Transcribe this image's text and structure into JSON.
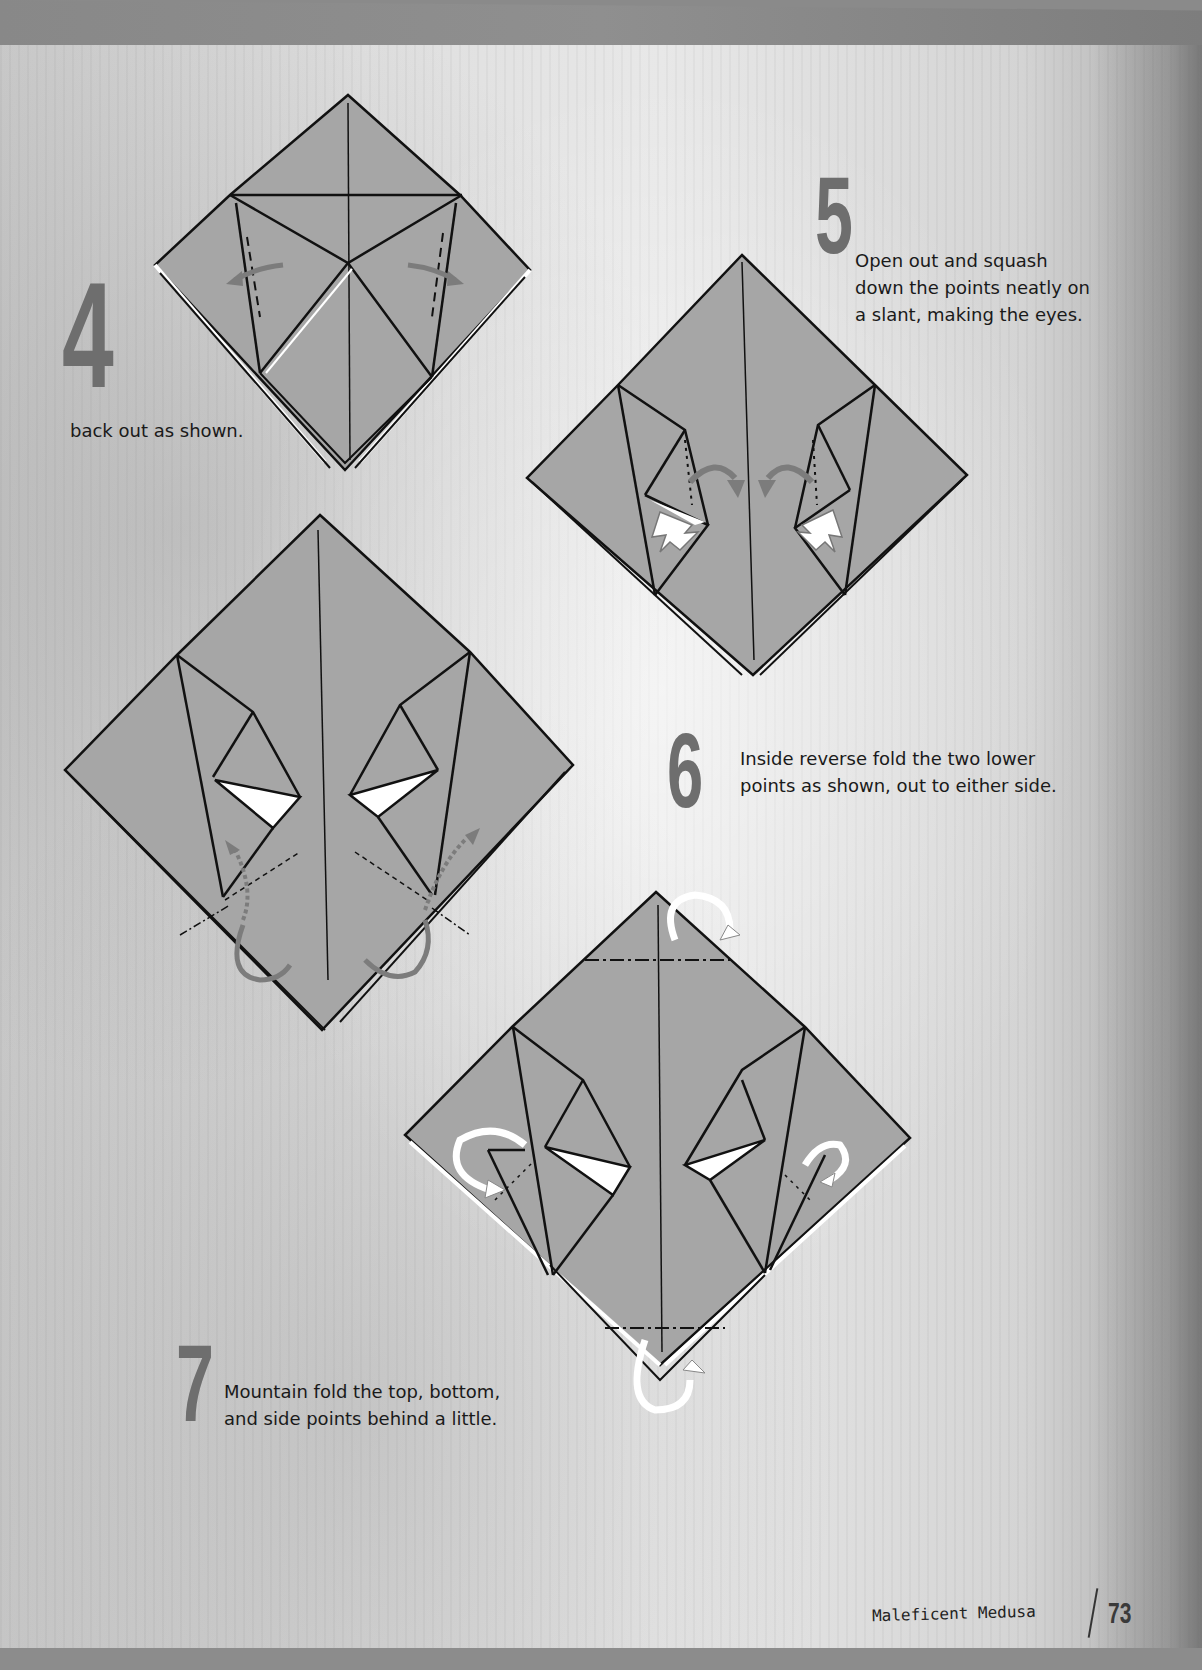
{
  "page": {
    "number": "73",
    "running_title": "Maleficent Medusa"
  },
  "colors": {
    "paper_fill": "#a6a6a6",
    "line": "#111111",
    "arrow_gray": "#7c7c7c",
    "step_number": "#6e6e6e",
    "band": "#8a8a8a"
  },
  "steps": [
    {
      "number": "4",
      "text": "back out as shown.",
      "icons": [
        "valley-fold-dashed-line",
        "fold-arrow-left",
        "fold-arrow-right"
      ]
    },
    {
      "number": "5",
      "text": "Open out and squash\ndown the points neatly on\na slant, making the eyes.",
      "icons": [
        "squash-arrow-left",
        "squash-arrow-right",
        "push-arrow-left",
        "push-arrow-right"
      ]
    },
    {
      "number": "6",
      "text": "Inside reverse fold the two lower\npoints as shown, out to either side.",
      "icons": [
        "reverse-fold-arrow-left",
        "reverse-fold-arrow-right",
        "dotted-arrow-left",
        "dotted-arrow-right"
      ]
    },
    {
      "number": "7",
      "text": "Mountain fold the top, bottom,\nand side points behind a little.",
      "icons": [
        "mountain-fold-arrow-top",
        "mountain-fold-arrow-bottom",
        "mountain-fold-arrow-left",
        "mountain-fold-arrow-right"
      ]
    }
  ]
}
